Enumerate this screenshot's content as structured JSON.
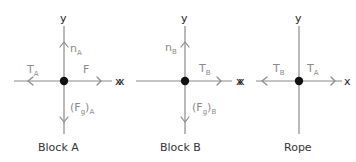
{
  "diagrams": [
    {
      "title": "Block A",
      "axis_x": "x",
      "axis_y": "y",
      "forces": [
        {
          "label": "n",
          "sub": "A",
          "direction": "up"
        },
        {
          "label": "T",
          "sub": "A",
          "direction": "left"
        },
        {
          "label": "F",
          "sub": "",
          "direction": "right"
        },
        {
          "label": "(F",
          "sub2": "g",
          "close": ")",
          "sub": "A",
          "direction": "down"
        }
      ]
    },
    {
      "title": "Block B",
      "axis_x": "x",
      "axis_y": "y",
      "forces": [
        {
          "label": "n",
          "sub": "B",
          "direction": "up"
        },
        {
          "label": "T",
          "sub": "B",
          "direction": "right"
        },
        {
          "label": "(F",
          "sub2": "g",
          "close": ")",
          "sub": "B",
          "direction": "down"
        }
      ]
    },
    {
      "title": "Rope",
      "axis_x": "x",
      "axis_y": "y",
      "forces": [
        {
          "label": "T",
          "sub": "B",
          "direction": "left"
        },
        {
          "label": "T",
          "sub": "A",
          "direction": "right"
        }
      ]
    }
  ],
  "colors": {
    "axis": "#8a8a8a",
    "dot": "#111111",
    "text": "#333333"
  }
}
